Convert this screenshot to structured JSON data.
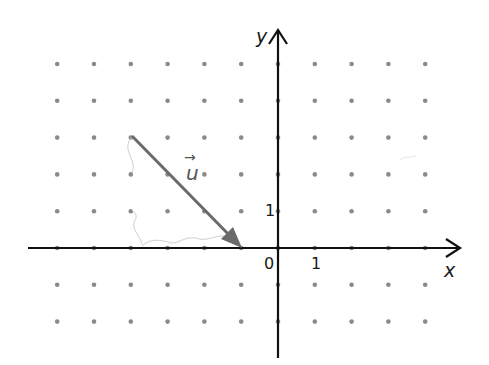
{
  "diagram": {
    "type": "vector-on-dot-grid",
    "grid": {
      "origin_px": [
        278,
        248
      ],
      "unit_px": 36.8,
      "x_dots": [
        -6,
        -5,
        -4,
        -3,
        -2,
        -1,
        1,
        2,
        3,
        4
      ],
      "y_dots": [
        -2,
        -1,
        1,
        2,
        3,
        4,
        5
      ],
      "dot_color": "#8a8a8a"
    },
    "axes": {
      "x_label": "x",
      "y_label": "y",
      "origin_label": "0",
      "x_unit_label": "1",
      "y_unit_label": "1",
      "axis_color": "#111111",
      "x_range": [
        -7.3,
        5.1
      ],
      "y_range": [
        -3.0,
        6.0
      ]
    },
    "vector": {
      "name": "u",
      "label": "u",
      "arrow_glyph": "→",
      "tail": [
        -4,
        3
      ],
      "head": [
        -1,
        0
      ],
      "components": [
        3,
        -3
      ],
      "color": "#6a6a6a"
    },
    "annotations": {
      "pencil_color": "#c8c8c8"
    }
  }
}
